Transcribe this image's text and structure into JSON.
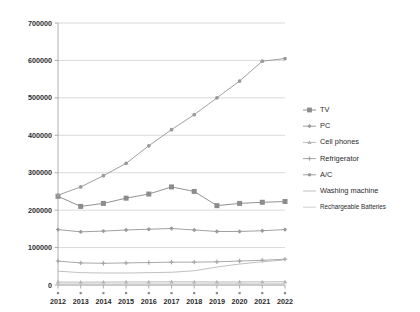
{
  "chart_data": {
    "type": "line",
    "title": "",
    "xlabel": "",
    "ylabel": "",
    "grid": true,
    "legend_position": "right",
    "ylim": [
      0,
      700000
    ],
    "yticks": [
      "0",
      "100000",
      "200000",
      "300000",
      "400000",
      "500000",
      "600000",
      "700000"
    ],
    "categories": [
      "2012",
      "2013",
      "2014",
      "2015",
      "2016",
      "2017",
      "2018",
      "2019",
      "2020",
      "2021",
      "2022"
    ],
    "series": [
      {
        "name": "TV",
        "color": "#8c8c8c",
        "marker": "square",
        "values": [
          237000,
          210000,
          218000,
          232000,
          243000,
          262000,
          250000,
          212000,
          218000,
          221000,
          223000
        ]
      },
      {
        "name": "PC",
        "color": "#9b9b9b",
        "marker": "diamond",
        "values": [
          148000,
          142000,
          144000,
          147000,
          149000,
          151000,
          147000,
          143000,
          143000,
          145000,
          148000
        ]
      },
      {
        "name": "Cell phones",
        "color": "#b5b5b5",
        "marker": "triangle",
        "values": [
          8000,
          7500,
          7800,
          8000,
          8200,
          8500,
          8300,
          8000,
          8200,
          8400,
          8600
        ]
      },
      {
        "name": "Refrigerator",
        "color": "#a3a3a3",
        "marker": "cross",
        "values": [
          64000,
          59000,
          58000,
          59000,
          60000,
          61000,
          61000,
          62000,
          64000,
          66000,
          69000
        ]
      },
      {
        "name": "A/C",
        "color": "#9a9a9a",
        "marker": "circle",
        "values": [
          240000,
          262000,
          292000,
          325000,
          372000,
          415000,
          455000,
          500000,
          545000,
          598000,
          605000
        ]
      },
      {
        "name": "Washing machine",
        "color": "#bdbdbd",
        "marker": "none",
        "values": [
          37000,
          33000,
          32000,
          32000,
          33000,
          34000,
          38000,
          48000,
          56000,
          62000,
          67000
        ]
      },
      {
        "name": "Rechargeable Batteries",
        "color": "#cccccc",
        "marker": "none",
        "values": [
          3000,
          2800,
          2800,
          2900,
          3000,
          3100,
          3100,
          3200,
          3300,
          3400,
          3500
        ]
      }
    ]
  }
}
